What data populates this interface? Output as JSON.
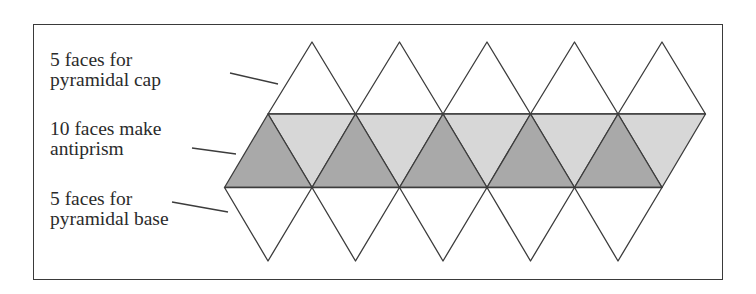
{
  "figure": {
    "type": "icosahedron-net",
    "frame": {
      "x": 33,
      "y": 24,
      "width": 690,
      "height": 256
    },
    "geometry": {
      "side": 87.5,
      "top_apex_y": 42,
      "upper_row_y": 114,
      "lower_row_y": 187.5,
      "bottom_apex_y": 261,
      "upper_row_start_x": 268,
      "lower_row_start_x": 224.5,
      "top_apex_start_x": 312,
      "bottom_apex_start_x": 268,
      "count": 5
    },
    "colors": {
      "stroke": "#3c3c3c",
      "cap_fill": "#ffffff",
      "antiprism_dark": "#a9a9a9",
      "antiprism_light": "#d7d7d7",
      "base_fill": "#ffffff"
    }
  },
  "labels": [
    {
      "id": "cap",
      "lines": [
        "5 faces for",
        "pyramidal cap"
      ],
      "x": 50,
      "y": 50,
      "leader": {
        "x1": 230,
        "y1": 73,
        "x2": 278,
        "y2": 84
      }
    },
    {
      "id": "antiprism",
      "lines": [
        "10 faces make",
        "antiprism"
      ],
      "x": 50,
      "y": 119,
      "leader": {
        "x1": 192,
        "y1": 148,
        "x2": 236,
        "y2": 154
      }
    },
    {
      "id": "base",
      "lines": [
        "5 faces for",
        "pyramidal base"
      ],
      "x": 50,
      "y": 189,
      "leader": {
        "x1": 172,
        "y1": 202,
        "x2": 228,
        "y2": 212
      }
    }
  ]
}
